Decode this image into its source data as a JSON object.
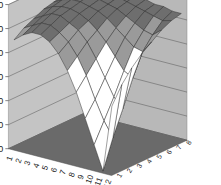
{
  "chart_data": {
    "type": "surface3d",
    "title": "",
    "xlabel": "",
    "ylabel": "",
    "zlabel": "",
    "ylim": [
      0,
      60
    ],
    "y_ticks": [
      "0",
      "10",
      "20",
      "30",
      "40",
      "50",
      "60"
    ],
    "categories": [
      "1",
      "2",
      "3",
      "4",
      "5",
      "6",
      "7",
      "8",
      "9",
      "10",
      "11",
      "12"
    ],
    "series_names": [
      "1",
      "2",
      "3",
      "4",
      "5",
      "6",
      "7",
      "8"
    ],
    "grid": true,
    "legend": "none",
    "series": [
      {
        "name": "1",
        "values": [
          45,
          48,
          50,
          50,
          48,
          44,
          38,
          30,
          20,
          10,
          0,
          28
        ]
      },
      {
        "name": "2",
        "values": [
          48,
          50,
          52,
          52,
          50,
          47,
          42,
          35,
          26,
          18,
          12,
          35
        ]
      },
      {
        "name": "3",
        "values": [
          50,
          52,
          54,
          54,
          52,
          50,
          46,
          40,
          33,
          26,
          22,
          40
        ]
      },
      {
        "name": "4",
        "values": [
          52,
          54,
          55,
          55,
          54,
          52,
          49,
          45,
          40,
          35,
          33,
          44
        ]
      },
      {
        "name": "5",
        "values": [
          53,
          55,
          56,
          56,
          55,
          54,
          52,
          49,
          46,
          43,
          42,
          47
        ]
      },
      {
        "name": "6",
        "values": [
          54,
          56,
          57,
          57,
          56,
          55,
          54,
          52,
          50,
          48,
          47,
          50
        ]
      },
      {
        "name": "7",
        "values": [
          55,
          56,
          57,
          57,
          57,
          56,
          55,
          54,
          53,
          52,
          51,
          52
        ]
      },
      {
        "name": "8",
        "values": [
          55,
          56,
          57,
          57,
          57,
          57,
          56,
          55,
          54,
          54,
          53,
          53
        ]
      }
    ],
    "band_colors": {
      "0-10": "#000000",
      "10-20": "#ffffff",
      "20-30": "#ffffff",
      "30-40": "#ffffff",
      "40-50": "#9a9a9a",
      "50-60": "#6e6e6e"
    },
    "colors": {
      "walls": "#b8b8b8",
      "floor": "#6a6a6a",
      "gridline": "#555555",
      "mesh": "#2a2a2a"
    }
  }
}
